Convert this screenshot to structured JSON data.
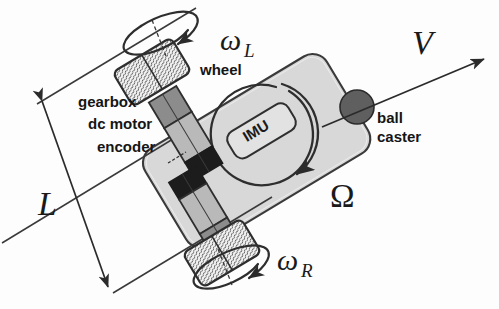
{
  "figure": {
    "background_color": "#fdfdfd",
    "line_color": "#333333"
  },
  "labels": {
    "wheel": "wheel",
    "gearbox": "gearbox",
    "dc_motor": "dc motor",
    "encoder": "encoder",
    "ball": "ball",
    "caster": "caster",
    "imu": "IMU"
  },
  "symbols": {
    "omega_left": "ω",
    "omega_left_sub": "L",
    "omega_right": "ω",
    "omega_right_sub": "R",
    "velocity": "V",
    "body_rotation": "Ω",
    "wheelbase": "L"
  },
  "colors": {
    "body_fill": "#d8d8d8",
    "wheel_fill": "#f0f0f0",
    "gearbox_fill": "#8a8a8a",
    "motor_fill": "#b8b8b8",
    "encoder_fill": "#1a1a1a",
    "caster_fill": "#5a5a5a",
    "stroke": "#333333",
    "text": "#151515"
  },
  "annotations": {
    "wheel_left_spin": "counter-clockwise arc arrow above left wheel",
    "wheel_right_spin": "counter-clockwise arc arrow below right wheel",
    "body_spin": "large circular arrow inside chassis",
    "velocity_arrow": "forward velocity vector from ball caster",
    "wheelbase_dimension": "double headed arrow spanning wheel axis"
  }
}
